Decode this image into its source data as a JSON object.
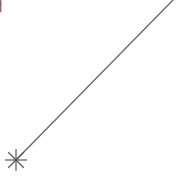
{
  "diagram": {
    "corner_glyph": "┤",
    "line": {
      "x1": 16,
      "y1": 160,
      "x2": 173,
      "y2": 0,
      "color": "#666666",
      "width": 1.3
    },
    "marker": {
      "type": "asterisk",
      "cx": 16,
      "cy": 160,
      "r": 11,
      "color": "#555555"
    }
  }
}
